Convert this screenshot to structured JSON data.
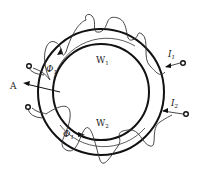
{
  "diagram": {
    "type": "toroidal-core-two-windings",
    "colors": {
      "stroke": "#111111",
      "winding": "#333333",
      "background": "#ffffff"
    },
    "labels": {
      "W1": {
        "main": "W",
        "sub": "1"
      },
      "W2": {
        "main": "W",
        "sub": "2"
      },
      "Phi1_top": {
        "main": "Φ",
        "sub": "1"
      },
      "Phi1_bottom": {
        "main": "Φ",
        "sub": "1"
      },
      "I1": {
        "main": "I",
        "sub": "1"
      },
      "I2": {
        "main": "I",
        "sub": "2"
      },
      "A": "A"
    },
    "terminals": [
      {
        "name": "left-top",
        "cx": 29,
        "cy": 66
      },
      {
        "name": "left-bottom",
        "cx": 28,
        "cy": 107
      },
      {
        "name": "right-top",
        "cx": 183,
        "cy": 63
      },
      {
        "name": "right-bottom",
        "cx": 186,
        "cy": 114
      }
    ]
  }
}
